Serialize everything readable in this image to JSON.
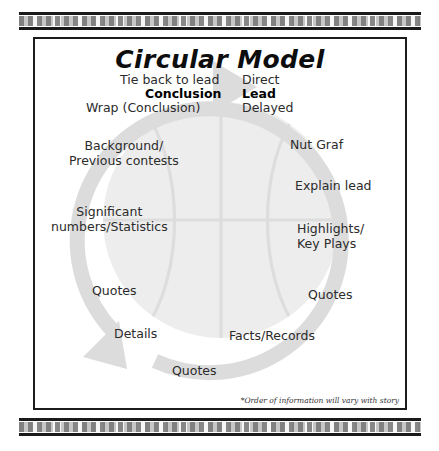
{
  "document": {
    "title": "Circular Model",
    "footnote": "*Order of information will vary with story"
  },
  "decor": {
    "top_band_name": "top-rule-band",
    "bottom_band_name": "bottom-rule-band"
  },
  "artwork": {
    "description": "faint basketball watermark with large gray circular arrow loop",
    "ball_color": "#ededed",
    "ball_seam_color": "#dcdcdc",
    "arrow_color": "#d9d9d9"
  },
  "labels": [
    {
      "id": "tie-back-to-lead",
      "text": "Tie back to lead",
      "bold": false,
      "x": 85,
      "y": 34,
      "align": "left"
    },
    {
      "id": "conclusion",
      "text": "Conclusion",
      "bold": true,
      "x": 110,
      "y": 48,
      "align": "left"
    },
    {
      "id": "wrap-conclusion",
      "text": "Wrap (Conclusion)",
      "bold": false,
      "x": 51,
      "y": 62,
      "align": "left"
    },
    {
      "id": "direct",
      "text": "Direct",
      "bold": false,
      "x": 207,
      "y": 34,
      "align": "left"
    },
    {
      "id": "lead",
      "text": "Lead",
      "bold": true,
      "x": 207,
      "y": 48,
      "align": "left"
    },
    {
      "id": "delayed",
      "text": "Delayed",
      "bold": false,
      "x": 207,
      "y": 62,
      "align": "left"
    },
    {
      "id": "background-previous",
      "text": "Background/\nPrevious contests",
      "bold": false,
      "x": 34,
      "y": 100,
      "align": "center"
    },
    {
      "id": "significant-numbers",
      "text": "Significant\nnumbers/Statistics",
      "bold": false,
      "x": 16,
      "y": 166,
      "align": "center"
    },
    {
      "id": "quotes-left-upper",
      "text": "Quotes",
      "bold": false,
      "x": 57,
      "y": 245,
      "align": "left"
    },
    {
      "id": "details",
      "text": "Details",
      "bold": false,
      "x": 79,
      "y": 288,
      "align": "left"
    },
    {
      "id": "quotes-bottom",
      "text": "Quotes",
      "bold": false,
      "x": 137,
      "y": 325,
      "align": "left"
    },
    {
      "id": "nut-graf",
      "text": "Nut Graf",
      "bold": false,
      "x": 255,
      "y": 99,
      "align": "left"
    },
    {
      "id": "explain-lead",
      "text": "Explain lead",
      "bold": false,
      "x": 260,
      "y": 140,
      "align": "left"
    },
    {
      "id": "highlights-key-plays",
      "text": "Highlights/\nKey Plays",
      "bold": false,
      "x": 262,
      "y": 183,
      "align": "left"
    },
    {
      "id": "quotes-right-lower",
      "text": "Quotes",
      "bold": false,
      "x": 273,
      "y": 249,
      "align": "left"
    },
    {
      "id": "facts-records",
      "text": "Facts/Records",
      "bold": false,
      "x": 194,
      "y": 290,
      "align": "left"
    }
  ]
}
